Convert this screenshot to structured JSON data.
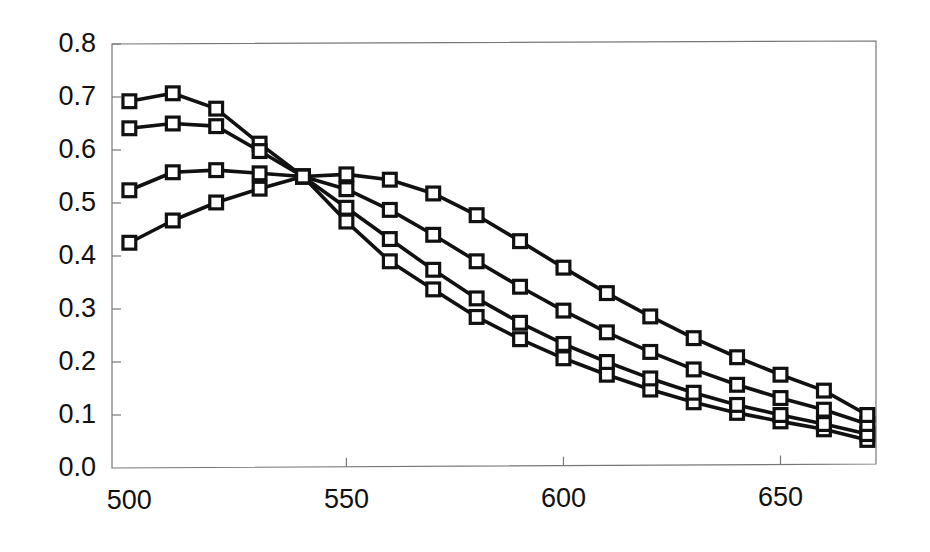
{
  "chart_data": {
    "type": "line",
    "title": "",
    "subtitle": "",
    "xlabel": "",
    "ylabel": "",
    "xlim": [
      496,
      672
    ],
    "ylim": [
      0.0,
      0.8
    ],
    "grid": false,
    "legend": false,
    "legend_position": "none",
    "marker": "open-square",
    "line_color": "#111111",
    "marker_fill": "#ffffff",
    "axis_color": "#777777",
    "xticks": [
      500,
      550,
      600,
      650
    ],
    "xtick_labels": [
      "500",
      "550",
      "600",
      "650"
    ],
    "yticks": [
      0.0,
      0.1,
      0.2,
      0.3,
      0.4,
      0.5,
      0.6,
      0.7,
      0.8
    ],
    "ytick_labels": [
      "0.0",
      "0.1",
      "0.2",
      "0.3",
      "0.4",
      "0.5",
      "0.6",
      "0.7",
      "0.8"
    ],
    "x": [
      500,
      510,
      520,
      530,
      540,
      550,
      560,
      570,
      580,
      590,
      600,
      610,
      620,
      630,
      640,
      650,
      660,
      670
    ],
    "annotations": [
      "four curves cross at a common isosbestic point near 540 nm, 0.55"
    ],
    "series": [
      {
        "name": "curve-1",
        "values": [
          0.692,
          0.707,
          0.678,
          0.612,
          0.55,
          0.465,
          0.39,
          0.337,
          0.285,
          0.243,
          0.207,
          0.176,
          0.148,
          0.124,
          0.104,
          0.088,
          0.073,
          0.053
        ]
      },
      {
        "name": "curve-2",
        "values": [
          0.641,
          0.65,
          0.645,
          0.598,
          0.55,
          0.491,
          0.432,
          0.374,
          0.32,
          0.274,
          0.234,
          0.2,
          0.169,
          0.142,
          0.119,
          0.1,
          0.083,
          0.064
        ]
      },
      {
        "name": "curve-3",
        "values": [
          0.524,
          0.558,
          0.562,
          0.556,
          0.55,
          0.526,
          0.487,
          0.44,
          0.39,
          0.342,
          0.297,
          0.256,
          0.219,
          0.186,
          0.157,
          0.132,
          0.11,
          0.083
        ]
      },
      {
        "name": "curve-4",
        "values": [
          0.425,
          0.467,
          0.501,
          0.527,
          0.55,
          0.554,
          0.544,
          0.518,
          0.477,
          0.428,
          0.378,
          0.33,
          0.286,
          0.245,
          0.209,
          0.176,
          0.146,
          0.1
        ]
      }
    ]
  }
}
